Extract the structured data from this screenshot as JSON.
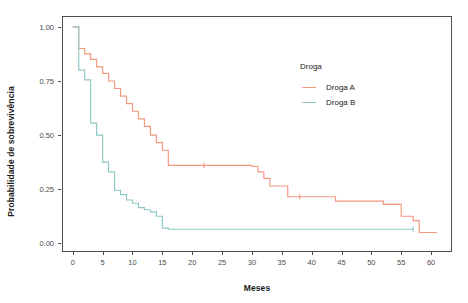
{
  "chart_data": {
    "type": "line",
    "title": "",
    "subtitle": "",
    "xlabel": "Meses",
    "ylabel": "Probabilidade de sobrevivência",
    "xlim": [
      -1.8,
      63.5
    ],
    "ylim": [
      -0.04,
      1.05
    ],
    "xticks": [
      0,
      5,
      10,
      15,
      20,
      25,
      30,
      35,
      40,
      45,
      50,
      55,
      60
    ],
    "yticks": [
      0.0,
      0.25,
      0.5,
      0.75,
      1.0
    ],
    "xticklabels": [
      "0",
      "5",
      "10",
      "15",
      "20",
      "25",
      "30",
      "35",
      "40",
      "45",
      "50",
      "55",
      "60"
    ],
    "yticklabels": [
      "0.00",
      "0.25",
      "0.50",
      "0.75",
      "1.00"
    ],
    "grid": false,
    "legend_position": "inside-upper-right",
    "legend_title": "Droga",
    "panel_border_color": "#4d4d4d",
    "background": "#ffffff",
    "series": [
      {
        "name": "Droga A",
        "color": "#F4977E",
        "step": "hv",
        "x": [
          0.0,
          1.0,
          1.0,
          2.0,
          2.0,
          3.0,
          3.0,
          4.0,
          4.0,
          5.0,
          5.0,
          6.0,
          6.0,
          7.0,
          7.0,
          8.0,
          8.0,
          9.0,
          9.0,
          10.0,
          10.0,
          11.0,
          11.0,
          12.0,
          12.0,
          13.0,
          13.0,
          14.0,
          14.0,
          15.0,
          15.0,
          16.0,
          16.0,
          30.0,
          30.0,
          31.0,
          31.0,
          32.0,
          32.0,
          33.0,
          33.0,
          36.0,
          36.0,
          44.0,
          44.0,
          52.0,
          52.0,
          55.0,
          55.0,
          57.0,
          57.0,
          58.0,
          58.0,
          61.0
        ],
        "y": [
          1.0,
          1.0,
          0.9,
          0.9,
          0.875,
          0.875,
          0.85,
          0.85,
          0.815,
          0.815,
          0.785,
          0.785,
          0.75,
          0.75,
          0.715,
          0.715,
          0.68,
          0.68,
          0.645,
          0.645,
          0.61,
          0.61,
          0.575,
          0.575,
          0.54,
          0.54,
          0.5,
          0.5,
          0.465,
          0.465,
          0.43,
          0.43,
          0.36,
          0.36,
          0.355,
          0.355,
          0.33,
          0.33,
          0.3,
          0.3,
          0.265,
          0.265,
          0.215,
          0.215,
          0.195,
          0.195,
          0.18,
          0.18,
          0.125,
          0.125,
          0.105,
          0.105,
          0.05,
          0.05
        ],
        "censor_marks": [
          {
            "x": 22.0,
            "y": 0.36
          },
          {
            "x": 38.0,
            "y": 0.215
          }
        ]
      },
      {
        "name": "Droga B",
        "color": "#8FC6C4",
        "step": "hv",
        "x": [
          0.0,
          1.0,
          1.0,
          2.0,
          2.0,
          3.0,
          3.0,
          4.0,
          4.0,
          5.0,
          5.0,
          6.0,
          6.0,
          7.0,
          7.0,
          8.0,
          8.0,
          9.0,
          9.0,
          10.0,
          10.0,
          11.0,
          11.0,
          12.0,
          12.0,
          13.0,
          13.0,
          14.0,
          14.0,
          15.0,
          15.0,
          16.0,
          16.0,
          57.0
        ],
        "y": [
          1.0,
          1.0,
          0.8,
          0.8,
          0.755,
          0.755,
          0.555,
          0.555,
          0.5,
          0.5,
          0.375,
          0.375,
          0.33,
          0.33,
          0.245,
          0.245,
          0.225,
          0.225,
          0.2,
          0.2,
          0.185,
          0.185,
          0.165,
          0.165,
          0.155,
          0.155,
          0.145,
          0.145,
          0.125,
          0.125,
          0.07,
          0.07,
          0.065,
          0.065
        ],
        "censor_marks": [
          {
            "x": 57.0,
            "y": 0.065
          }
        ]
      }
    ]
  },
  "legend": {
    "title": "Droga",
    "items": [
      {
        "label": "Droga A",
        "color": "#F4977E"
      },
      {
        "label": "Droga B",
        "color": "#8FC6C4"
      }
    ]
  },
  "axes": {
    "x_title": "Meses",
    "y_title": "Probabilidade de sobrevivência",
    "x_tick_labels": [
      "0",
      "5",
      "10",
      "15",
      "20",
      "25",
      "30",
      "35",
      "40",
      "45",
      "50",
      "55",
      "60"
    ],
    "y_tick_labels": [
      "0.00",
      "0.25",
      "0.50",
      "0.75",
      "1.00"
    ]
  }
}
